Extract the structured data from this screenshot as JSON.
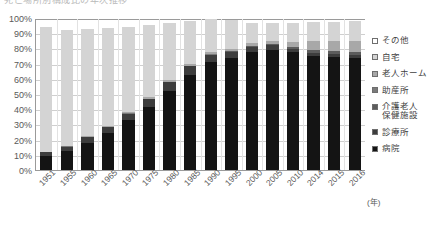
{
  "title": {
    "text": "死亡場所別構成比の年次推移",
    "cropped": true
  },
  "axis": {
    "y_ticks": [
      "100%",
      "90%",
      "80%",
      "70%",
      "60%",
      "50%",
      "40%",
      "30%",
      "20%",
      "10%",
      "0%"
    ],
    "x_unit_label": "(年)"
  },
  "legend": {
    "position": "right",
    "items": [
      {
        "label": "その他",
        "key": "other",
        "color": "#ffffff"
      },
      {
        "label": "自宅",
        "key": "home",
        "color": "#d4d4d4"
      },
      {
        "label": "老人ホーム",
        "key": "nursing_home",
        "color": "#a8a8a8"
      },
      {
        "label": "助産所",
        "key": "midwifery_home",
        "color": "#7a7a7a"
      },
      {
        "label": "介護老人\n保健施設",
        "key": "geriatric_health_facility",
        "color": "#5c5c5c"
      },
      {
        "label": "診療所",
        "key": "clinic",
        "color": "#3d3d3d"
      },
      {
        "label": "病院",
        "key": "hospital",
        "color": "#141414"
      }
    ]
  },
  "chart_data": {
    "type": "bar",
    "stacked": true,
    "stack_total": 100,
    "title": "死亡場所別構成比の年次推移",
    "xlabel": "(年)",
    "ylabel": "",
    "ylim": [
      0,
      100
    ],
    "ytick_step": 10,
    "grid": true,
    "legend_position": "right",
    "unit": "%",
    "categories": [
      "1951",
      "1955",
      "1960",
      "1965",
      "1970",
      "1975",
      "1980",
      "1985",
      "1990",
      "1995",
      "2000",
      "2005",
      "2010",
      "2014",
      "2015",
      "2016"
    ],
    "series": [
      {
        "name": "病院",
        "color": "#141414",
        "values": [
          9.1,
          12.3,
          18.2,
          24.6,
          32.9,
          41.8,
          52.1,
          63.0,
          71.6,
          74.1,
          78.2,
          79.8,
          77.9,
          75.2,
          74.6,
          73.9
        ]
      },
      {
        "name": "診療所",
        "color": "#3d3d3d",
        "values": [
          2.6,
          3.1,
          3.7,
          3.9,
          4.5,
          5.3,
          6.0,
          5.9,
          4.9,
          4.2,
          3.2,
          2.8,
          2.4,
          2.2,
          2.2,
          2.1
        ]
      },
      {
        "name": "介護老人保健施設",
        "color": "#5c5c5c",
        "values": [
          0.0,
          0.0,
          0.0,
          0.0,
          0.0,
          0.0,
          0.0,
          0.0,
          0.0,
          0.3,
          0.5,
          0.8,
          1.3,
          2.1,
          2.3,
          2.5
        ]
      },
      {
        "name": "助産所",
        "color": "#7a7a7a",
        "values": [
          0.3,
          0.3,
          0.3,
          0.2,
          0.2,
          0.1,
          0.1,
          0.1,
          0.1,
          0.0,
          0.0,
          0.0,
          0.0,
          0.0,
          0.0,
          0.0
        ]
      },
      {
        "name": "老人ホーム",
        "color": "#a8a8a8",
        "values": [
          0.2,
          0.3,
          0.4,
          0.6,
          0.8,
          1.0,
          1.2,
          1.5,
          1.5,
          1.5,
          1.9,
          2.1,
          3.5,
          5.8,
          6.3,
          6.9
        ]
      },
      {
        "name": "自宅",
        "color": "#d4d4d4",
        "values": [
          82.5,
          76.9,
          70.7,
          65.0,
          56.6,
          47.7,
          38.0,
          28.3,
          21.7,
          19.3,
          13.9,
          12.2,
          12.6,
          12.8,
          12.7,
          13.0
        ]
      },
      {
        "name": "その他",
        "color": "#ffffff",
        "values": [
          5.3,
          7.1,
          6.7,
          5.7,
          5.0,
          4.1,
          2.6,
          1.2,
          0.2,
          0.6,
          2.3,
          2.3,
          2.3,
          1.9,
          1.9,
          1.6
        ]
      }
    ]
  }
}
